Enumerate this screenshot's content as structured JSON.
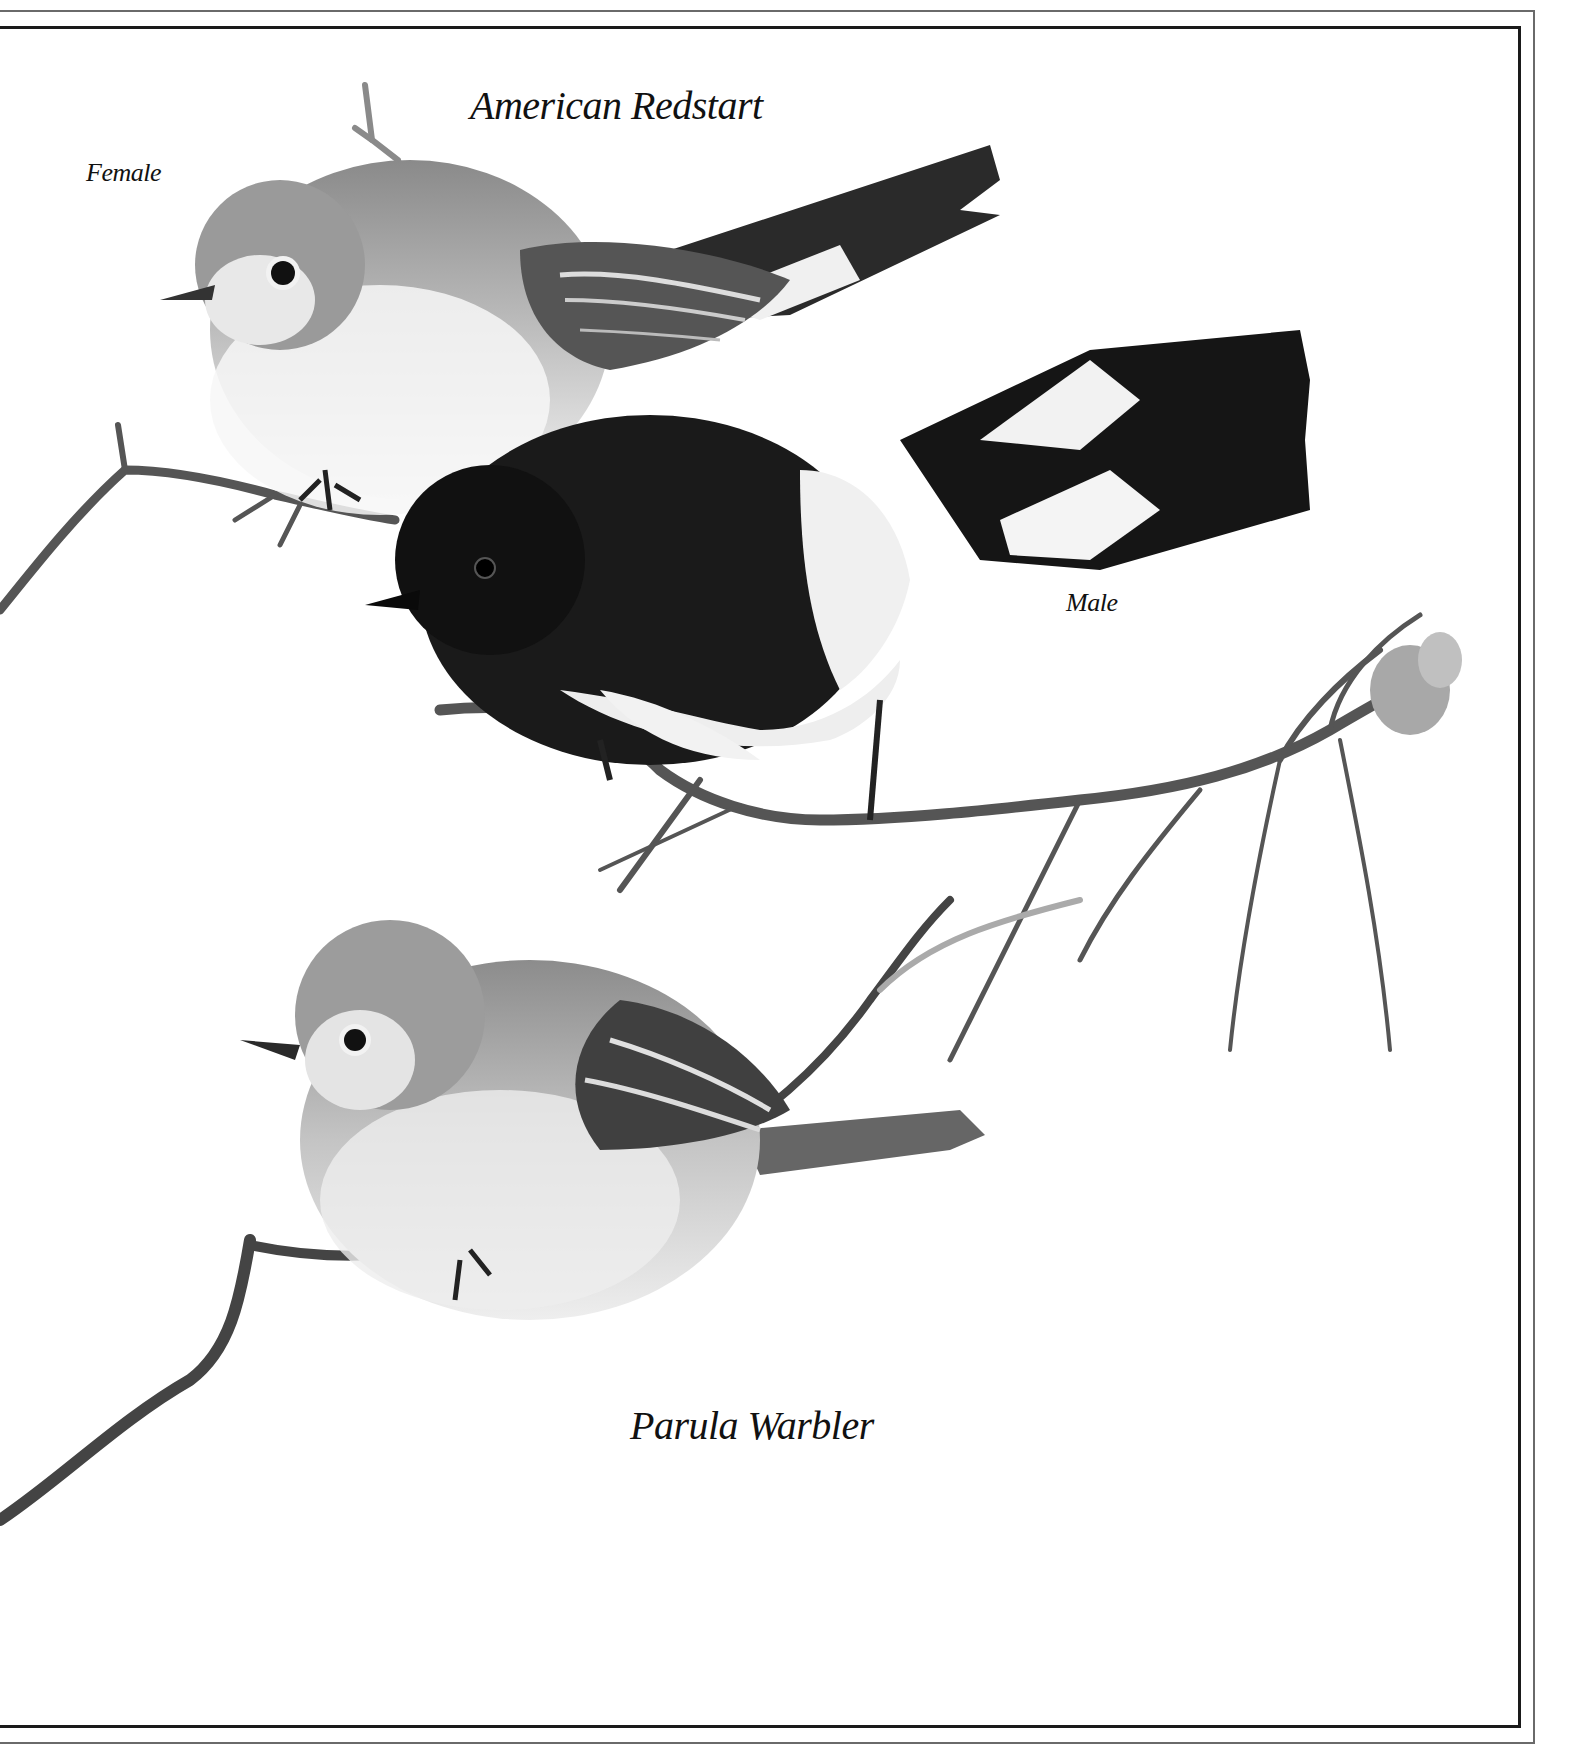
{
  "plate": {
    "title": "American Redstart",
    "labels": {
      "female": "Female",
      "male": "Male"
    },
    "secondary_title": "Parula Warbler"
  },
  "illustration": {
    "style": "monochrome pencil/ink bird illustration",
    "subjects": [
      {
        "name": "American Redstart",
        "variant": "Female",
        "position": "upper-left, perched on branch"
      },
      {
        "name": "American Redstart",
        "variant": "Male",
        "position": "center, perched on branch, black with white wing and tail patches"
      },
      {
        "name": "Parula Warbler",
        "position": "lower-left, perched on branch"
      }
    ],
    "colors": {
      "background": "#ffffff",
      "ink": "#111111",
      "frame_outer": "#6a6a6a",
      "frame_inner": "#1a1a1a"
    }
  }
}
